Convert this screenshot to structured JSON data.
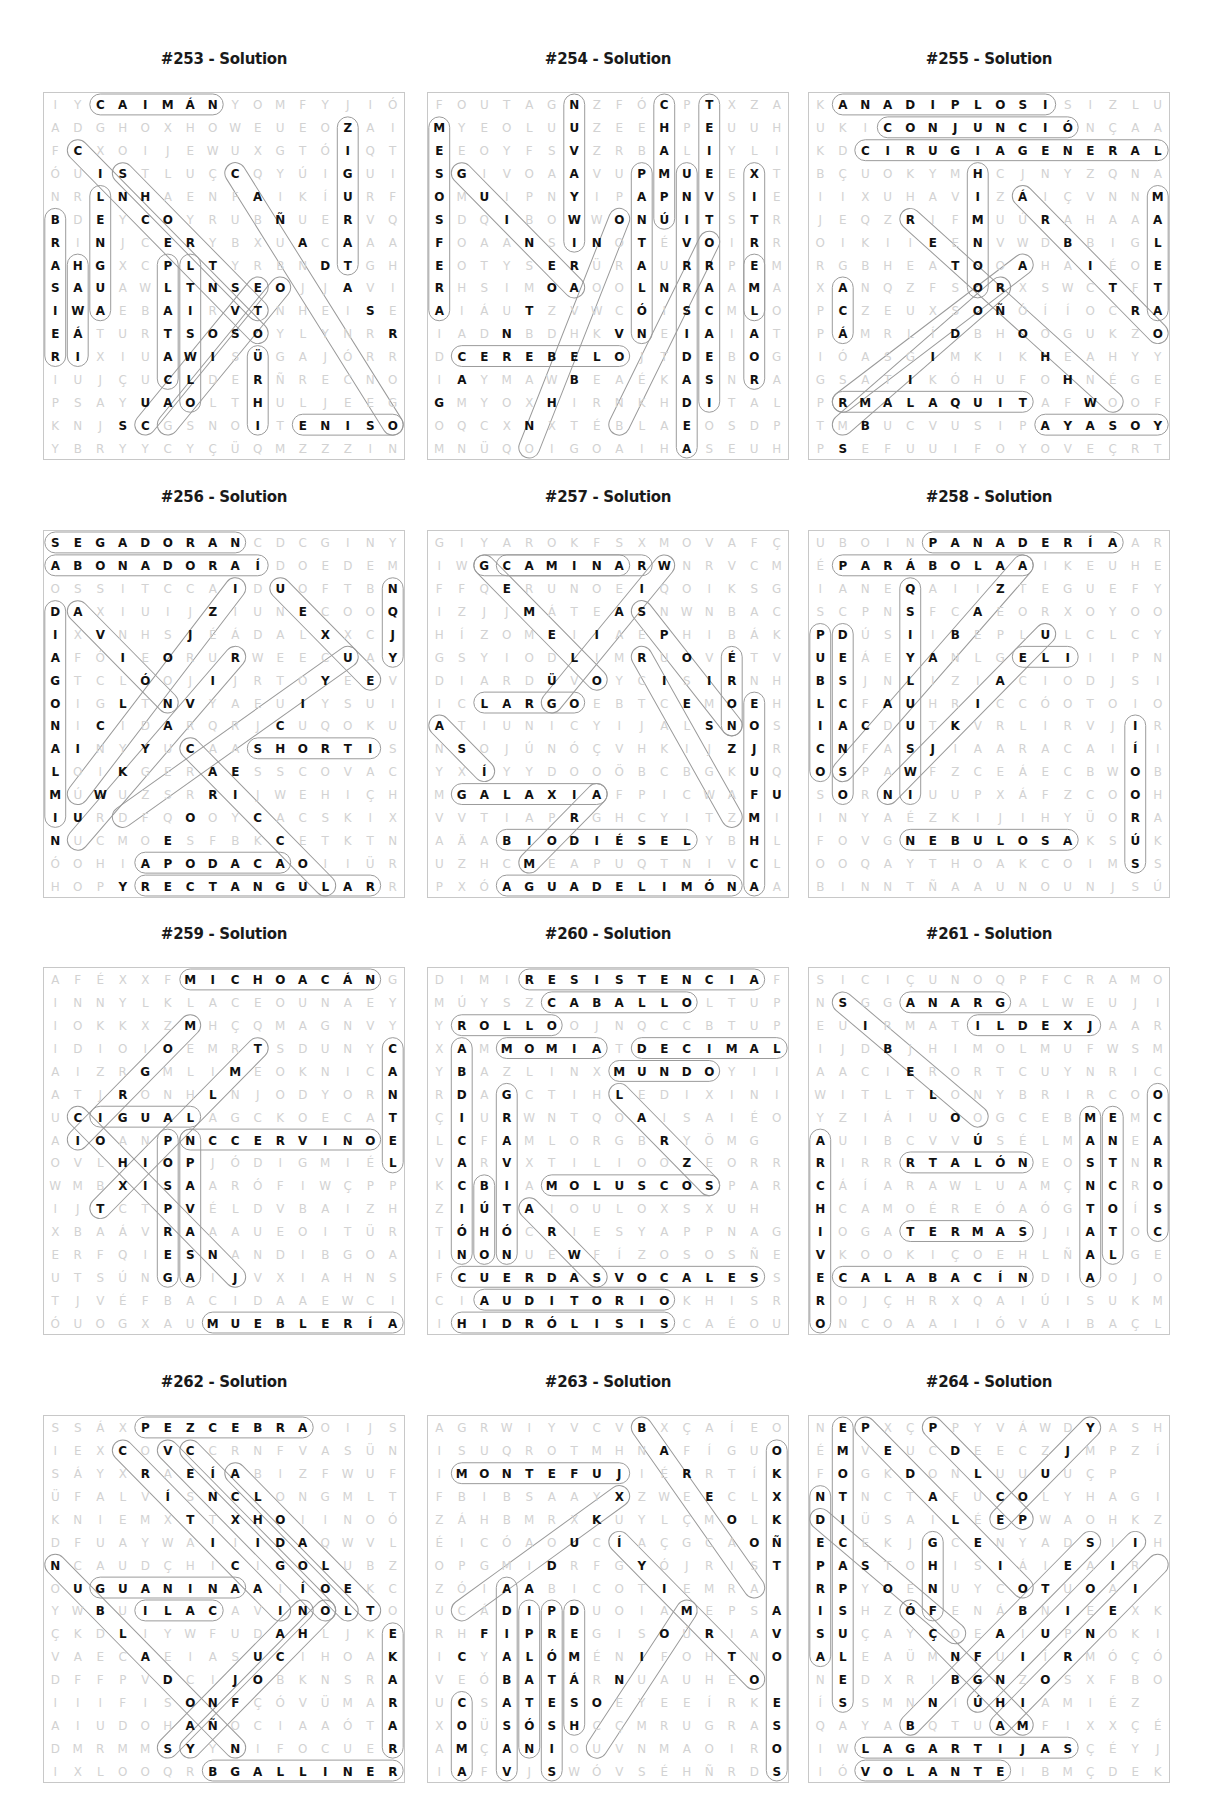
{
  "page": {
    "title_suffix": "Solution"
  },
  "layout": {
    "cols_x": [
      43,
      427,
      808
    ],
    "rows_y": [
      50,
      488,
      925,
      1373
    ],
    "grid_size": 16
  },
  "panels": [
    {
      "id": "253",
      "title": "#253 - Solution",
      "rows": [
        "IYCAIMÁNYOMFYJIÓ",
        "ADGHOXHOWEUEOZAI",
        "FCXOIJEWUXGTÓIQT",
        "ÓUISTLUÇCQYÚIGUI",
        "NRLNHAENFAIKÍURF",
        "BDEYCOYRUBÑUERVQ",
        "RINJCERYBXUACAAA",
        "AHGXCPLTYRBNDTGH",
        "SAUAWLTNSEOJJAVI",
        "IWAEBAIRVTNHEISE",
        "EÁTURTSOSOYLYNRR",
        "RIXIUAWISÜGAJÓRR",
        "IUJÇUCLDERÑRECNO",
        "PSAYUAOLTHULJEEG",
        "KNJSCGSNOITENISO",
        "YBRYYCYÇÜQMZZZIN"
      ],
      "words": [
        "CAIMÁN",
        "ZIGURAT",
        "LENGUA",
        "BRASIER",
        "HAWÁI",
        "PLATA",
        "SET",
        "TENIS"
      ]
    },
    {
      "id": "254",
      "title": "#254 - Solution",
      "rows": [
        "FOUTAGNZFÓCPTXZA",
        "MYEOLUUZEEHPEUUH",
        "EEOYFSVZRBALIYLI",
        "SGIVOAAVUPMUEEXT",
        "OMUIPNYIPAPNVSIE",
        "SDQIBOWWONÚITSTR",
        "FOAANSINOTÉVOIRR",
        "EOTYSERÜRAURRPEM",
        "RHSIMOAOOLNRAAMA",
        "AIÁUTZVWCÓISCMLO",
        "IADNBDHKVNEIAIAT",
        "DCEREBELOJTDEBOG",
        "IAYMAWBEAÉKASNRA",
        "GMYOXHIRNKHDITAL",
        "OQCXNXTÉBLAEOSDP",
        "MNÜQOIGOAIHASEUH"
      ],
      "words": [
        "GUSANOS",
        "CHAMPÚ",
        "UNIVERSIDAD",
        "MESOSFERA",
        "PANTALÓN",
        "CEREBELO",
        "TELEVISOR",
        "TERREMOTO",
        "PALABRA",
        "ESTIRAMIENTO",
        "HIERRO"
      ]
    },
    {
      "id": "255",
      "title": "#255 - Solution",
      "rows": [
        "KANADIPLOSISIZLU",
        "UKICONJUNCIÓNÇAA",
        "KDCIRUGIAGENERAL",
        "BÇUOKYMHCJNYZQNA",
        "IIXUHAVIZÁIÇVNNM",
        "JEQZRIFMUÚRAHAAA",
        "OIKIIEENVWDBBIGL",
        "RGBHEATOOAHAIÉOE",
        "XANQZFSORXSWCTFT",
        "PCZEUXSOÑÓÍÍOCRA",
        "PÁMRLÍDBHOOGUKZO",
        "IÓASGIMKIKHEAHYY",
        "GSATIKÓHUFOHNÉGE",
        "PRMALAQUITAFWOOF",
        "TMBUCVUSIPAYASOY",
        "PSEFUUIFOYOVEÇRT"
      ],
      "words": [
        "ANADIPLOSIS",
        "CONJUNCIÓN",
        "CIRUGIAGENERAL",
        "HIMNO",
        "MALETA",
        "MALAQUITA",
        "PAYASO",
        "ACÁ"
      ]
    },
    {
      "id": "256",
      "title": "#256 - Solution",
      "rows": [
        "SEGADORANCDCGINY",
        "ABONADORAÍDOEDEM",
        "OSSITCCAIDUOFTBN",
        "DAXIUIJZIUNECOOQ",
        "IXVNHSJÉÁDALXXCJ",
        "AFÓIEORURWEECUAY",
        "GTCLÓOJIJRTOYEEV",
        "OIGLTNVYAEUIYSUI",
        "NICIDARQRJCUQOKU",
        "AINYYUCAASHORTIS",
        "LOIKGERAESSCOVAC",
        "MÚWUZSRRIJWEHIÇH",
        "IURDFQOOYCACSKIX",
        "NUCMOESFBKCETKTN",
        "ÓOHIAPODACAOIIÜR",
        "HOPYRECTANGULARR"
      ],
      "words": [
        "SEGADORA",
        "ABONADORA",
        "DIAGONAL",
        "SHORT",
        "APODACA",
        "RECTANGULAR",
        "BOCA",
        "DULCE"
      ]
    },
    {
      "id": "257",
      "title": "#257 - Solution",
      "rows": [
        "GIYAROKFSXMOVAFÇ",
        "IWGCAMINARWNRVCM",
        "FFQERUNOEIQOIKSG",
        "IZJJMÁTEASNWNBAC",
        "HÍZOMEIIAEPHIBÁK",
        "GSYIODLIMRUOVÉTV",
        "DIARDÜVOYCISIRNH",
        "ICLARGOEBTCEMOEH",
        "ATIUNICYIJALSNOS",
        "NSOJÚNÓÇVHKIJZJR",
        "YXÍYYDOOÖBCBGKUQ",
        "MGALAXIAFPICWAFU",
        "VVTIAPRGHCYITZMI",
        "AÄABIODIÉSELYBHL",
        "UZHCMEAPUQTNIVCL",
        "PXÓAGUADELIMÓNAA"
      ],
      "words": [
        "CAMINAR",
        "LARGO",
        "GALAXIA",
        "BIODIÉSEL",
        "AGUADELIMÓN",
        "TREN",
        "HORQUILLA",
        "ASÍ"
      ]
    },
    {
      "id": "258",
      "title": "#258 - Solution",
      "rows": [
        "UBOINPANADERÍAAR",
        "ÉPARÁBOLAAIKEUHE",
        "IANEQAIIZTEGUEFY",
        "SCPNSFCAEORXOYOO",
        "PDÚSIIBEPLULCLCY",
        "UEÁEYANLGELIIIPN",
        "BSJNLIZIACIODJSI",
        "LCFAUHRICCÓOTOIO",
        "IACDUTKVRLIRVJIR",
        "CNFASJIAARACAIÍI",
        "OSPAWFZCEÁECBWOB",
        "SORNIUUPXÁFZCOOH",
        "INYAÉZKIJIHYÜORA",
        "FOVGNEBULOSAKSÚK",
        "OOQAYTHOAKCOIMSS",
        "BINNTÑAAUNOUNJSÚ"
      ],
      "words": [
        "PANADERÍA",
        "PARÁBOLA",
        "ENSENADA",
        "PÚBLICOS",
        "DESCANSO",
        "NEBULOSA",
        "GEL",
        "VÍBORAS"
      ]
    },
    {
      "id": "259",
      "title": "#259 - Solution",
      "rows": [
        "AFÉXXFMICHOACÁNG",
        "INNYLKLACEOUNAEY",
        "IOKKXZMHÇQMAGNVY",
        "IDIOIOEMRTSDUNYC",
        "AIZRGMLIMEOKNICA",
        "ATJRONHLNJODYORN",
        "UCIGUALAGCKOECAT",
        "AIOANPNCCERVINOE",
        "OVLHIOPJÓDIGMIÉL",
        "WMBXISAARÓFIWÇPP",
        "IJTCTPVÉLDVBAIZH",
        "XBAÁVRAAAUEOITÜR",
        "ERFQIESNANDIBGOA",
        "UTSÚNGAIJVXIAHNS",
        "TJVÉFBACIDAAEWCI",
        "ÓUOGXAUMUEBLERÍA"
      ],
      "words": [
        "MICHOACÁN",
        "IGUALA",
        "CERVINO",
        "MUEBLERÍA",
        "CARTEL",
        "SILLA"
      ]
    },
    {
      "id": "260",
      "title": "#260 - Solution",
      "rows": [
        "DIMIRESISTENCIAF",
        "MÚYSZCABALLOLTUP",
        "YROLLOOJNQCCBTUP",
        "XAMMOMIATDECIMAL",
        "YBAZLINXMUNDOYII",
        "RDAGCTIHLEDIXINI",
        "ÇIURWNTQOAISAIÉO",
        "LCFAMLORGBRYÖMG",
        "VARVXTILIOOZEORR",
        "KCBIAMOLUSCOSPAR",
        "ZIÚTAIOULOXSXUH",
        "TÓHÓCRIESYAPPNAG",
        "INONUEWFÍZOSOSÑE",
        "FCUERDASVOCALESS",
        "CIAUDITORIOKHISR",
        "IHIDRÓLISISCAÉOU"
      ],
      "words": [
        "RESISTENCIA",
        "CABALLO",
        "ROLLO",
        "MOMIA",
        "DECIMAL",
        "MUNDO",
        "MOLUSCOS",
        "CUERDASVOCALES",
        "AUDITORIO",
        "HIDRÓLISIS",
        "ABDICACIÓN",
        "GRAVITACIÓN",
        "LOBO"
      ]
    },
    {
      "id": "261",
      "title": "#261 - Solution",
      "rows": [
        "SICIÇUNOQPFCRAMO",
        "NSGGANARGALWEUJI",
        "EUIRMATILDEXJAAR",
        "IJDBJHIMOLMUFWSM",
        "AACIERORTCUYNRIC",
        "WITLTLONYBRIRCOO",
        "YZIÁIUOOGCEBMEMC",
        "AUIBCVVÚSÉLMANEA",
        "RIRRRTALÓNEOSTNR",
        "CÁÍARAWLUAMÇNCRO",
        "HCAMOÉREÓAÓGTOÍS",
        "IOGATERMASJIATOC",
        "VKOOKIÇOEHLÑALGE",
        "ECALABACÍNDIAOJO",
        "ROJÇHRXQAIÚISUKM",
        "ONCOAAIIÓVAIBAÇL"
      ],
      "words": [
        "GANAR",
        "MATILDE",
        "TALÓN",
        "TERMAS",
        "CALABACÍN",
        "ARCHIVERO",
        "SUJETO",
        "MONTOS",
        "MANCHAS",
        "ESTORNUDO"
      ]
    },
    {
      "id": "262",
      "title": "#262 - Solution",
      "rows": [
        "SSÁXPEZCEBRAOIJS",
        "IEXCOVCCRNFVASÜN",
        "SÁYXRAEÍABIZFWUF",
        "ÜFALVÍSNCLONGMLT",
        "KNIEMXTTXHOIINOÓ",
        "DFUAYWAIIIDAQWVL",
        "NCAUDÇHICIGOLUBZ",
        "OUGUANINAAIÍOEKC",
        "YWBUILACAVINOLTO",
        "ÇKDLIYWFUDAHLJKE",
        "VAECAEIASUCIHOAK",
        "DFFPVDCIJOBKNSRA",
        "IIIFISONFÇÓVÜMAR",
        "AIUDOHAÑOCIAAÓTA",
        "DMRMMSYYNIFOCUER",
        "IXLOOQRBGALLINERO"
      ],
      "words": [
        "PEZCEBRA",
        "GUANINA",
        "LACA",
        "GALLINERO",
        "KARATE",
        "TOKE"
      ]
    },
    {
      "id": "263",
      "title": "#263 - Solution",
      "rows": [
        "AGRWIYVCVBXÇAÍEO",
        "ISUQROTMHNAFÍGUO",
        "IMONTEFUJIÉRRTÍK",
        "FBIBSAAYXZWEECLX",
        "ZÁHBMRXKUYLÇMOLK",
        "ÉICÓAOUCÍAÇGCAOÑ",
        "OPGMIDRFGYÓJRIST",
        "ZÓIAABICOTIEMRA",
        "UCÁDIPDUOIAMEPSA",
        "RHFIPREGISOÚRIAV",
        "ICYALÓMÉNIFOHTNO",
        "VEÓBATÁRNUAUHEO",
        "UCSATESOEYEEÍRKE",
        "XOÜSÓSHCÇMRUGRAS",
        "AMÇANIOUVNMAOIRO",
        "IAFVJSWÓVSÉHÑRDS"
      ],
      "words": [
        "MONTEFUJI",
        "BARELA",
        "HUEVO",
        "DIABASA",
        "PLATÓN",
        "PRÓTESIS",
        "DEMÁS",
        "COMA",
        "HUEVOSRANCHEROS"
      ]
    },
    {
      "id": "264",
      "title": "#264 - Solution",
      "rows": [
        "NEPXÇPPYVÁWDYASH",
        "ÉMVEUCDEECZJMPZÍ",
        "FOGKDONLUUUUÇP",
        "NTNCTAFUCOLYHAGI",
        "DIÜSAILÉEPWAOHKZ",
        "ECEKJGCENYADSIIH",
        "PASTOHISIÁIEAIR",
        "RPYOÉNUYCOTUOAI",
        "ISHZÓFENÁBNIEEXK",
        "SUÇAYÇOEAIUPNOKI",
        "ALEAÜMNFUIÍRMÓÇÓ",
        "NEDXRIBGNZOSXFBO",
        "ÍSSMNNIÚHIAMIÉZ",
        "QAYABQTUAMFIXXÇÉ",
        "IWLAGARTIJASÇÉYJ",
        "IÓVOLANTEIBMÇDEK"
      ],
      "words": [
        "EMOTICONES",
        "PEDALES",
        "PELO",
        "CINE",
        "LAGARTIJAS",
        "VOLANTE",
        "DEPRISA",
        "CÁPSULAS"
      ]
    }
  ]
}
